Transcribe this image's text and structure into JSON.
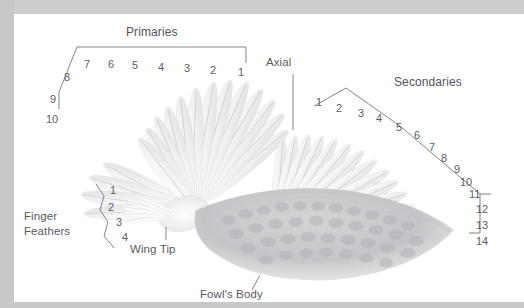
{
  "figure": {
    "frame_color": "#cfcfcf",
    "plate_color": "#ffffff",
    "line_color": "#808085",
    "text_color": "#59595c"
  },
  "labels": {
    "primaries": "Primaries",
    "secondaries": "Secondaries",
    "axial": "Axial",
    "finger_feathers_line1": "Finger",
    "finger_feathers_line2": "Feathers",
    "wing_tip": "Wing Tip",
    "fowls_body": "Fowl's Body"
  },
  "groups": {
    "primaries": {
      "label": "Primaries",
      "numbers": [
        "1",
        "2",
        "3",
        "4",
        "5",
        "6",
        "7",
        "8",
        "9",
        "10"
      ]
    },
    "secondaries": {
      "label": "Secondaries",
      "numbers": [
        "1",
        "2",
        "3",
        "4",
        "5",
        "6",
        "7",
        "8",
        "9",
        "10",
        "11",
        "12",
        "13",
        "14"
      ]
    },
    "finger_feathers": {
      "label": "Finger Feathers",
      "numbers": [
        "1",
        "2",
        "3",
        "4"
      ]
    }
  },
  "primaries_numbers": {
    "n1": "1",
    "n2": "2",
    "n3": "3",
    "n4": "4",
    "n5": "5",
    "n6": "6",
    "n7": "7",
    "n8": "8",
    "n9": "9",
    "n10": "10"
  },
  "secondaries_numbers": {
    "n1": "1",
    "n2": "2",
    "n3": "3",
    "n4": "4",
    "n5": "5",
    "n6": "6",
    "n7": "7",
    "n8": "8",
    "n9": "9",
    "n10": "10",
    "n11": "11",
    "n12": "12",
    "n13": "13",
    "n14": "14"
  },
  "finger_numbers": {
    "n1": "1",
    "n2": "2",
    "n3": "3",
    "n4": "4"
  }
}
